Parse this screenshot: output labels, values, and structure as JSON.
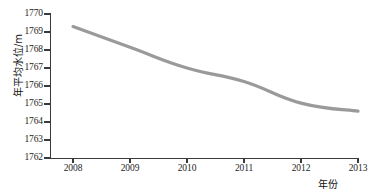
{
  "chart_data": {
    "type": "line",
    "title": "",
    "subtitle": "",
    "xlabel": "年份",
    "ylabel": "年平均水位/m",
    "x": [
      2008,
      2009,
      2010,
      2011,
      2012,
      2013
    ],
    "xtick_labels": [
      "2008",
      "2009",
      "2010",
      "2011",
      "2012",
      "2013"
    ],
    "ytick_labels": [
      "1770",
      "1769",
      "1768",
      "1767",
      "1766",
      "1765",
      "1764",
      "1763",
      "1762"
    ],
    "yticks": [
      1770,
      1769,
      1768,
      1767,
      1766,
      1765,
      1764,
      1763,
      1762
    ],
    "xlim": [
      2008,
      2013
    ],
    "ylim": [
      1762,
      1770
    ],
    "grid": false,
    "legend": null,
    "series": [
      {
        "name": "年平均水位",
        "color": "#9a9a9a",
        "values": [
          1769.3,
          1768.15,
          1767.0,
          1766.25,
          1765.05,
          1764.6
        ]
      }
    ]
  }
}
